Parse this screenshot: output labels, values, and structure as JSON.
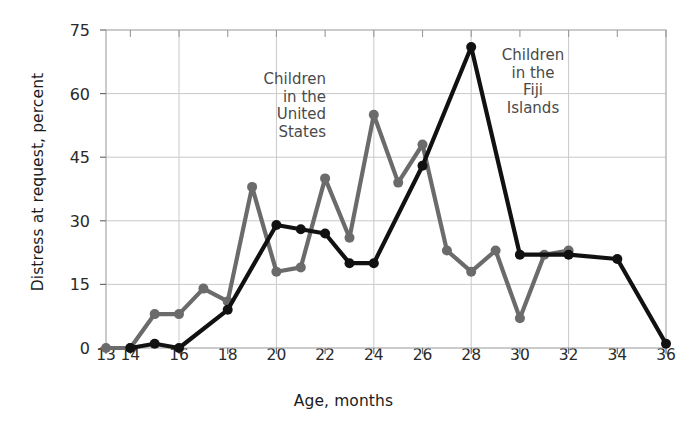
{
  "chart_data": {
    "type": "line",
    "title": "",
    "xlabel": "Age, months",
    "ylabel": "Distress at request, percent",
    "xlim": [
      13,
      36
    ],
    "ylim": [
      0,
      75
    ],
    "xticks": [
      13,
      14,
      16,
      18,
      20,
      22,
      24,
      26,
      28,
      30,
      32,
      34,
      36
    ],
    "yticks": [
      0,
      15,
      30,
      45,
      60,
      75
    ],
    "grid": true,
    "legend_position": "inline-annotation",
    "series": [
      {
        "name": "Children in the United States",
        "color": "#6b6b6b",
        "x": [
          13,
          14,
          15,
          16,
          17,
          18,
          19,
          20,
          21,
          22,
          23,
          24,
          25,
          26,
          27,
          28,
          29,
          30,
          31,
          32
        ],
        "values": [
          0,
          0,
          8,
          8,
          14,
          11,
          38,
          18,
          19,
          40,
          26,
          55,
          39,
          48,
          23,
          18,
          23,
          7,
          22,
          23
        ]
      },
      {
        "name": "Children in the Fiji Islands",
        "color": "#111111",
        "x": [
          14,
          15,
          16,
          18,
          20,
          21,
          22,
          23,
          24,
          26,
          28,
          30,
          32,
          34,
          36
        ],
        "values": [
          0,
          1,
          0,
          9,
          29,
          28,
          27,
          20,
          20,
          43,
          71,
          22,
          22,
          21,
          1
        ]
      }
    ],
    "annotations": [
      {
        "id": "us",
        "text": "Children\nin the\nUnited\nStates"
      },
      {
        "id": "fiji",
        "text": "Children\nin the\nFiji\nIslands"
      }
    ]
  }
}
